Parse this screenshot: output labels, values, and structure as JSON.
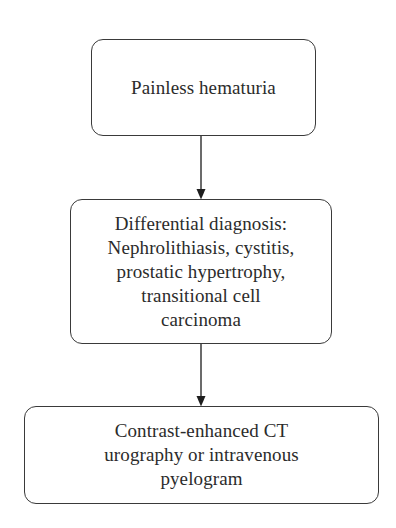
{
  "diagram": {
    "type": "flowchart",
    "direction": "top-to-bottom",
    "colors": {
      "background": "#ffffff",
      "stroke": "#3a3a3a",
      "text": "#2b2b2b"
    },
    "nodes": [
      {
        "id": "painless-hematuria",
        "lines": [
          "Painless hematuria"
        ]
      },
      {
        "id": "differential-diagnosis",
        "lines": [
          "Differential diagnosis:",
          "Nephrolithiasis, cystitis,",
          "prostatic hypertrophy,",
          "transitional cell",
          "carcinoma"
        ]
      },
      {
        "id": "imaging",
        "lines": [
          "Contrast-enhanced CT",
          "urography or intravenous",
          "pyelogram"
        ]
      }
    ],
    "edges": [
      {
        "from": "painless-hematuria",
        "to": "differential-diagnosis",
        "arrow": "filled-triangle"
      },
      {
        "from": "differential-diagnosis",
        "to": "imaging",
        "arrow": "filled-triangle"
      }
    ]
  }
}
